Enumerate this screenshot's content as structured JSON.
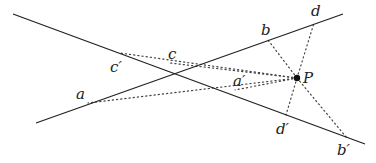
{
  "diagram": {
    "lines": [
      {
        "name": "line-1",
        "x1": 13,
        "y1": 14,
        "x2": 365,
        "y2": 144
      },
      {
        "name": "line-2",
        "x1": 36,
        "y1": 123,
        "x2": 343,
        "y2": 14
      }
    ],
    "point_P": {
      "x": 297,
      "y": 78,
      "label": "P",
      "lx": 303,
      "ly": 83
    },
    "points": [
      {
        "id": "a",
        "label": "a",
        "x": 88,
        "y": 103,
        "lx": 76,
        "ly": 99
      },
      {
        "id": "c",
        "label": "c",
        "x": 170,
        "y": 63,
        "lx": 168,
        "ly": 59
      },
      {
        "id": "b",
        "label": "b",
        "x": 268,
        "y": 40,
        "lx": 261,
        "ly": 35
      },
      {
        "id": "d",
        "label": "d",
        "x": 314,
        "y": 23,
        "lx": 311,
        "ly": 16
      },
      {
        "id": "c-prime",
        "label": "c′",
        "x": 120,
        "y": 53,
        "lx": 110,
        "ly": 72
      },
      {
        "id": "a-prime",
        "label": "a′",
        "x": 235,
        "y": 90,
        "lx": 233,
        "ly": 86
      },
      {
        "id": "d-prime",
        "label": "d′",
        "x": 286,
        "y": 115,
        "lx": 276,
        "ly": 134
      },
      {
        "id": "b-prime",
        "label": "b′",
        "x": 347,
        "y": 138,
        "lx": 337,
        "ly": 155
      }
    ]
  }
}
